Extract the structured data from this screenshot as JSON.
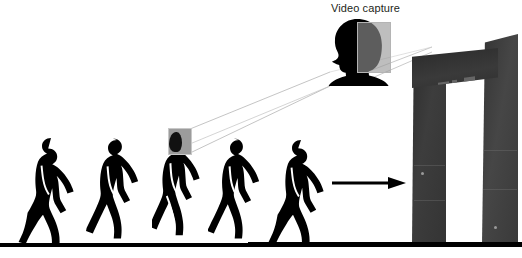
{
  "figure": {
    "title": "Video capture",
    "caption_text": "Video capture",
    "background_color": "#ffffff",
    "silhouette_color": "#000000",
    "capture_box_color": "#9c9c9c",
    "projection_line_color": "#b0b0b0",
    "gate_color": "#3a3a3a"
  },
  "labels": {
    "video_capture": "Video capture"
  },
  "walkers": {
    "count": 5,
    "description": "gait cycle silhouettes walking left to right",
    "items": [
      {
        "name": "walker-1",
        "phase": "heel strike",
        "left_px": 18,
        "height_px": 112
      },
      {
        "name": "walker-2",
        "phase": "mid stance",
        "left_px": 86,
        "height_px": 110
      },
      {
        "name": "walker-3",
        "phase": "toe off",
        "left_px": 152,
        "height_px": 112
      },
      {
        "name": "walker-4",
        "phase": "swing",
        "left_px": 208,
        "height_px": 110
      },
      {
        "name": "walker-5",
        "phase": "heel strike",
        "left_px": 268,
        "height_px": 110
      }
    ]
  },
  "capture": {
    "box_label": "head bounding box",
    "target_walker": "walker-3",
    "enlarged_head_label": "video capture head silhouette"
  },
  "arrow": {
    "label": "direction of travel",
    "direction": "right"
  },
  "gate": {
    "label": "walk-through metal detector",
    "panel_count": 4,
    "pillars": [
      "left-pillar",
      "right-pillar"
    ]
  },
  "ground": {
    "label": "ground line"
  }
}
